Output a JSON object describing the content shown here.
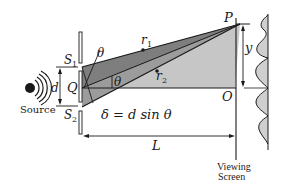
{
  "diagram": {
    "labels": {
      "source": "Source",
      "slit1": "S",
      "slit1_sub": "1",
      "slit2": "S",
      "slit2_sub": "2",
      "midpoint": "Q",
      "separation": "d",
      "theta_top": "θ",
      "theta_mid": "θ",
      "ray1": "r",
      "ray1_sub": "1",
      "ray2": "r",
      "ray2_sub": "2",
      "point_p": "P",
      "point_o": "O",
      "height": "y",
      "distance": "L",
      "path_difference": "δ = d sin θ",
      "screen_line1": "Viewing",
      "screen_line2": "Screen"
    },
    "colors": {
      "line": "#1a1a1a",
      "dark_region": "#7a7a7a",
      "light_region": "#c4c4c4",
      "mid_region": "#9a9a9a",
      "intensity_fill": "#cfcfcf",
      "background": "#ffffff"
    }
  }
}
